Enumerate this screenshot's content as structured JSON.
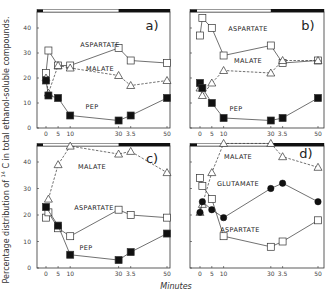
{
  "chart_data": {
    "type": "line",
    "ylabel_main": "Percentage distribution of",
    "ylabel_superscript": "14",
    "ylabel_rest": "C in total ethanol-soluble compounds.",
    "xlabel": "Minutes",
    "x_tick_values": [
      0,
      5,
      10,
      30,
      35,
      50
    ],
    "x_tick_labels": [
      "0",
      "5",
      "10",
      "30",
      "3.5",
      "50"
    ],
    "y_tick_values": [
      0,
      10,
      20,
      30,
      40
    ],
    "y_tick_labels": [
      "0",
      "10",
      "20",
      "30",
      "40"
    ],
    "xlim": [
      0,
      50
    ],
    "ylim": [
      0,
      47
    ],
    "light_dark_bar": {
      "dark_start_min": -2,
      "dark_end_min": 0,
      "light_end_min": 30,
      "dark2_end_min": 50
    },
    "panels": [
      {
        "label": "a)",
        "series": [
          {
            "name": "ASPARTATE",
            "marker": "open-square",
            "line": "solid",
            "x": [
              0,
              1,
              5,
              10,
              30,
              35,
              50
            ],
            "y": [
              22,
              31,
              25,
              25,
              32,
              27,
              26
            ]
          },
          {
            "name": "MALATE",
            "marker": "open-triangle",
            "line": "dashed",
            "x": [
              0,
              1,
              5,
              10,
              30,
              35,
              50
            ],
            "y": [
              20,
              14,
              25,
              24,
              21,
              17,
              19
            ]
          },
          {
            "name": "PEP",
            "marker": "filled-square",
            "line": "solid",
            "x": [
              0,
              1,
              5,
              10,
              30,
              35,
              50
            ],
            "y": [
              19,
              13,
              12,
              5,
              3,
              5,
              12
            ]
          }
        ]
      },
      {
        "label": "b)",
        "series": [
          {
            "name": "ASPARTATE",
            "marker": "open-square",
            "line": "solid",
            "x": [
              0,
              1,
              5,
              10,
              30,
              35,
              50
            ],
            "y": [
              37,
              44,
              40,
              29,
              33,
              26,
              27
            ]
          },
          {
            "name": "MALATE",
            "marker": "open-triangle",
            "line": "dashed",
            "x": [
              0,
              1,
              5,
              10,
              30,
              35,
              50
            ],
            "y": [
              16,
              13,
              18,
              23,
              22,
              27,
              27
            ]
          },
          {
            "name": "PEP",
            "marker": "filled-square",
            "line": "solid",
            "x": [
              0,
              1,
              5,
              10,
              30,
              35,
              50
            ],
            "y": [
              18,
              16,
              10,
              4,
              3,
              4,
              12
            ]
          }
        ]
      },
      {
        "label": "c)",
        "series": [
          {
            "name": "MALATE",
            "marker": "open-triangle",
            "line": "dashed",
            "x": [
              1,
              5,
              10,
              30,
              35,
              50
            ],
            "y": [
              26,
              39,
              46,
              43,
              44,
              36
            ]
          },
          {
            "name": "ASPARTATE",
            "marker": "open-square",
            "line": "solid",
            "x": [
              0,
              1,
              5,
              10,
              30,
              35,
              50
            ],
            "y": [
              19,
              21,
              15,
              12,
              22,
              20,
              19
            ]
          },
          {
            "name": "PEP",
            "marker": "filled-square",
            "line": "solid",
            "x": [
              0,
              5,
              10,
              30,
              35,
              50
            ],
            "y": [
              23,
              16,
              5,
              3,
              6,
              13
            ]
          }
        ]
      },
      {
        "label": "d)",
        "series": [
          {
            "name": "MALATE",
            "marker": "open-triangle",
            "line": "dashed",
            "x": [
              0,
              1,
              5,
              10,
              30,
              35,
              50
            ],
            "y": [
              21,
              24,
              36,
              47,
              47,
              42,
              38
            ]
          },
          {
            "name": "GLUTAMATE",
            "marker": "filled-circle",
            "line": "solid",
            "x": [
              0,
              1,
              5,
              10,
              30,
              35,
              50
            ],
            "y": [
              21,
              25,
              22,
              19,
              30,
              32,
              25
            ]
          },
          {
            "name": "ASPARTATE",
            "marker": "open-square",
            "line": "solid",
            "x": [
              0,
              1,
              5,
              10,
              30,
              35,
              50
            ],
            "y": [
              34,
              31,
              26,
              12,
              8,
              10,
              18
            ]
          }
        ]
      }
    ]
  }
}
